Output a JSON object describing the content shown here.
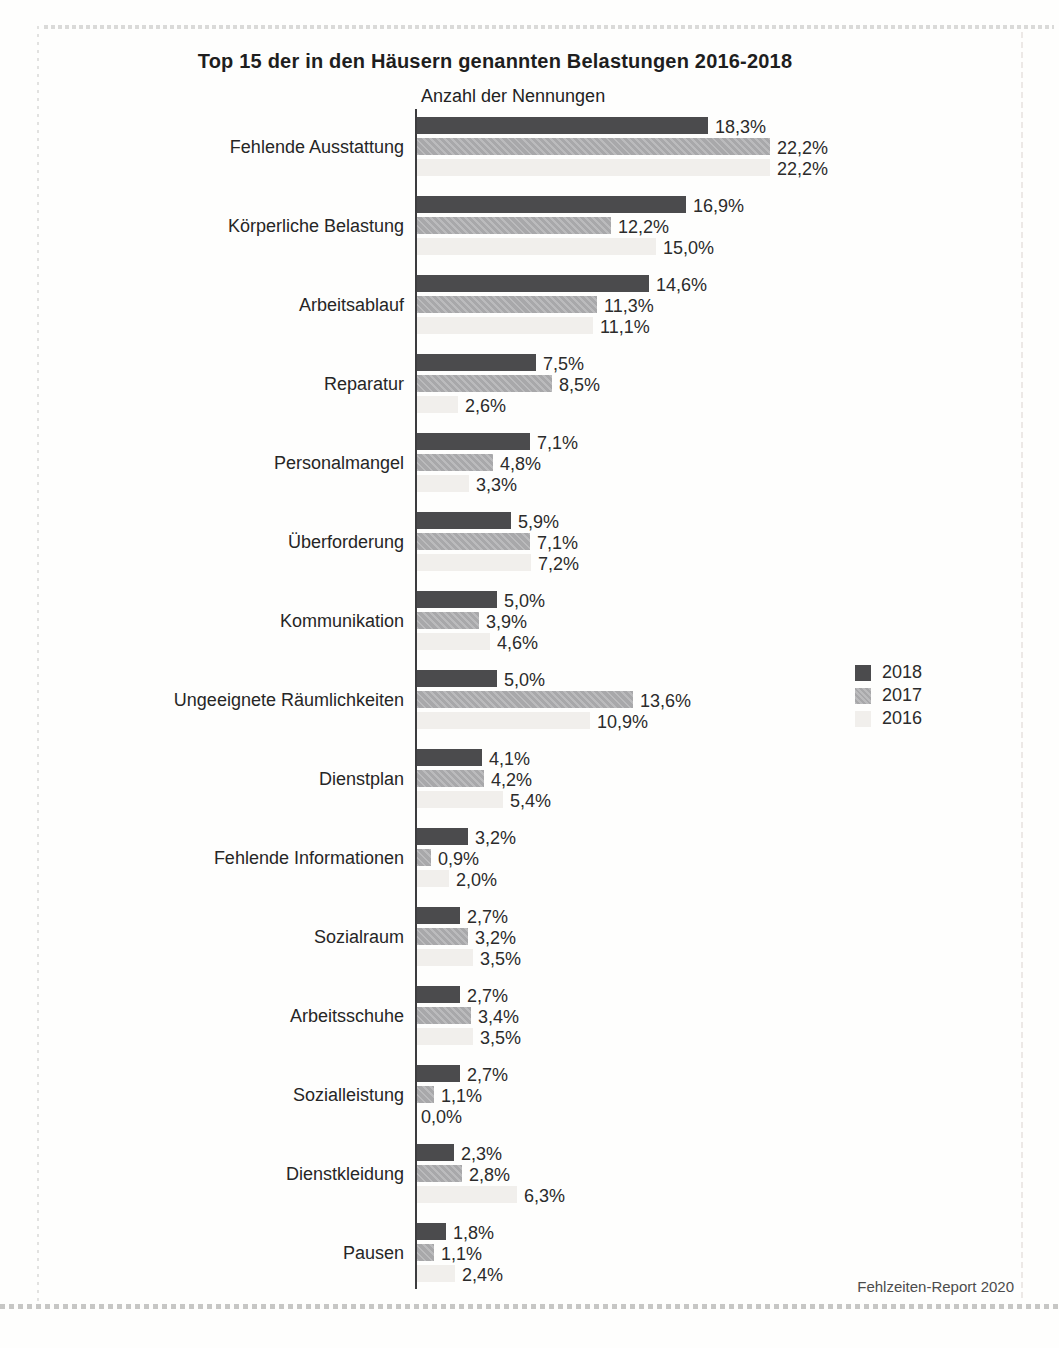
{
  "page": {
    "title": "Top 15 der in den Häusern genannten Belastungen 2016-2018",
    "axis_title": "Anzahl der Nennungen",
    "source": "Fehlzeiten-Report 2020"
  },
  "colors": {
    "series_2018": "#4b4b4d",
    "series_2017": "#a8a8aa",
    "series_2016": "#f1efec",
    "axis": "#3c3c3e",
    "text": "#2b2b2b"
  },
  "chart_data": {
    "type": "bar",
    "orientation": "horizontal",
    "title": "Top 15 der in den Häusern genannten Belastungen 2016-2018",
    "xlabel": "Anzahl der Nennungen",
    "value_unit": "percent",
    "xlim": [
      0,
      24
    ],
    "grid": false,
    "legend_position": "right",
    "categories": [
      "Fehlende Ausstattung",
      "Körperliche Belastung",
      "Arbeitsablauf",
      "Reparatur",
      "Personalmangel",
      "Überforderung",
      "Kommunikation",
      "Ungeeignete Räumlichkeiten",
      "Dienstplan",
      "Fehlende Informationen",
      "Sozialraum",
      "Arbeitsschuhe",
      "Sozialleistung",
      "Dienstkleidung",
      "Pausen"
    ],
    "series": [
      {
        "name": "2018",
        "color": "#4b4b4d",
        "values": [
          18.3,
          16.9,
          14.6,
          7.5,
          7.1,
          5.9,
          5.0,
          5.0,
          4.1,
          3.2,
          2.7,
          2.7,
          2.7,
          2.3,
          1.8
        ],
        "labels": [
          "18,3%",
          "16,9%",
          "14,6%",
          "7,5%",
          "7,1%",
          "5,9%",
          "5,0%",
          "5,0%",
          "4,1%",
          "3,2%",
          "2,7%",
          "2,7%",
          "2,7%",
          "2,3%",
          "1,8%"
        ]
      },
      {
        "name": "2017",
        "color": "#a8a8aa",
        "values": [
          22.2,
          12.2,
          11.3,
          8.5,
          4.8,
          7.1,
          3.9,
          13.6,
          4.2,
          0.9,
          3.2,
          3.4,
          1.1,
          2.8,
          1.1
        ],
        "labels": [
          "22,2%",
          "12,2%",
          "11,3%",
          "8,5%",
          "4,8%",
          "7,1%",
          "3,9%",
          "13,6%",
          "4,2%",
          "0,9%",
          "3,2%",
          "3,4%",
          "1,1%",
          "2,8%",
          "1,1%"
        ]
      },
      {
        "name": "2016",
        "color": "#f1efec",
        "values": [
          22.2,
          15.0,
          11.1,
          2.6,
          3.3,
          7.2,
          4.6,
          10.9,
          5.4,
          2.0,
          3.5,
          3.5,
          0.0,
          6.3,
          2.4
        ],
        "labels": [
          "22,2%",
          "15,0%",
          "11,1%",
          "2,6%",
          "3,3%",
          "7,2%",
          "4,6%",
          "10,9%",
          "5,4%",
          "2,0%",
          "3,5%",
          "3,5%",
          "0,0%",
          "6,3%",
          "2,4%"
        ]
      }
    ]
  }
}
